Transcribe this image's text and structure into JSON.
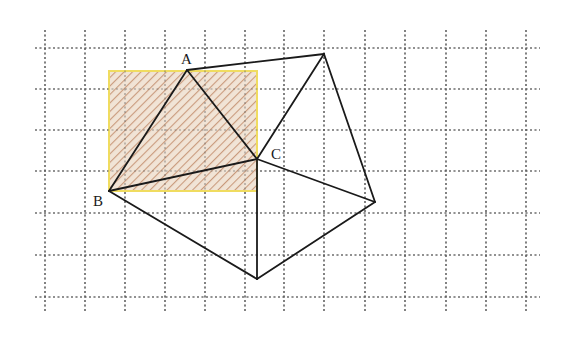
{
  "figure": {
    "grid": {
      "x_lines": [
        45,
        85,
        125,
        165,
        205,
        245,
        284,
        324,
        365,
        405,
        446,
        486,
        526
      ],
      "y_lines": [
        48,
        89,
        130,
        171,
        213,
        255,
        297
      ],
      "x_extent": [
        35,
        540
      ],
      "y_extent": [
        30,
        312
      ],
      "color": "#555555"
    },
    "rectangle": {
      "x": 109,
      "y": 71,
      "width": 148,
      "height": 120,
      "border": "#f0dc60",
      "fill": "#f1e4d6",
      "hatch": "#c99a7c"
    },
    "points": {
      "A": {
        "label": "A",
        "x": 187,
        "y": 70
      },
      "B": {
        "label": "B",
        "x": 109,
        "y": 191
      },
      "C": {
        "label": "C",
        "x": 257,
        "y": 159
      },
      "D": {
        "x": 324,
        "y": 54
      },
      "E": {
        "x": 375,
        "y": 202
      },
      "F": {
        "x": 257,
        "y": 279
      }
    },
    "segments": [
      [
        "A",
        "B"
      ],
      [
        "B",
        "C"
      ],
      [
        "C",
        "A"
      ],
      [
        "A",
        "D"
      ],
      [
        "D",
        "C"
      ],
      [
        "D",
        "E"
      ],
      [
        "C",
        "E"
      ],
      [
        "E",
        "F"
      ],
      [
        "F",
        "B"
      ],
      [
        "C",
        "F"
      ]
    ],
    "labels": {
      "A": {
        "text": "A",
        "x": 181,
        "y": 52
      },
      "B": {
        "text": "B",
        "x": 93,
        "y": 194
      },
      "C": {
        "text": "C",
        "x": 271,
        "y": 147
      }
    }
  }
}
